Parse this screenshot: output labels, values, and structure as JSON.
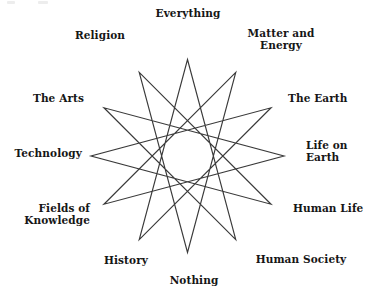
{
  "diagram": {
    "shape": "12-pointed star polygon {12/5}",
    "stroke_color": "#3a3a3a",
    "background_color": "#ffffff",
    "vertices": [
      {
        "index": 0,
        "label": "Everything",
        "position": "top",
        "angle_deg": 90
      },
      {
        "index": 1,
        "label": "Matter and\nEnergy",
        "position": "upper-right",
        "angle_deg": 60
      },
      {
        "index": 2,
        "label": "The Earth",
        "position": "right-upper",
        "angle_deg": 30
      },
      {
        "index": 3,
        "label": "Life on\nEarth",
        "position": "right",
        "angle_deg": 0
      },
      {
        "index": 4,
        "label": "Human Life",
        "position": "right-lower",
        "angle_deg": -30
      },
      {
        "index": 5,
        "label": "Human Society",
        "position": "lower-right",
        "angle_deg": -60
      },
      {
        "index": 6,
        "label": "Nothing",
        "position": "bottom",
        "angle_deg": -90
      },
      {
        "index": 7,
        "label": "History",
        "position": "lower-left",
        "angle_deg": -120
      },
      {
        "index": 8,
        "label": "Fields of\nKnowledge",
        "position": "left-lower",
        "angle_deg": -150
      },
      {
        "index": 9,
        "label": "Technology",
        "position": "left",
        "angle_deg": 180
      },
      {
        "index": 10,
        "label": "The Arts",
        "position": "left-upper",
        "angle_deg": 150
      },
      {
        "index": 11,
        "label": "Religion",
        "position": "upper-left",
        "angle_deg": 120
      }
    ]
  }
}
